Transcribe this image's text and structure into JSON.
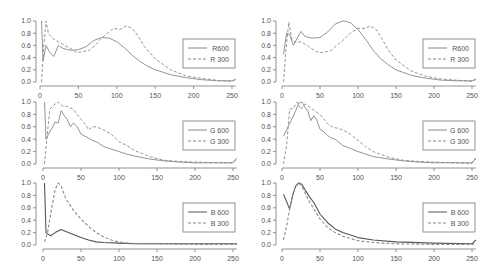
{
  "chart_data": [
    {
      "type": "line",
      "panel": "left-top",
      "xlim": [
        0,
        255
      ],
      "ylim": [
        0,
        1.0
      ],
      "xticks": [
        0,
        50,
        100,
        150,
        200,
        250
      ],
      "yticks": [
        "0.0",
        "0.2",
        "0.4",
        "0.6",
        "0.8",
        "1.0"
      ],
      "legend_position": "right",
      "series": [
        {
          "name": "R600",
          "style": "solid",
          "x": [
            2,
            4,
            8,
            12,
            18,
            24,
            30,
            36,
            42,
            50,
            60,
            70,
            80,
            90,
            100,
            110,
            120,
            130,
            140,
            150,
            170,
            190,
            210,
            230,
            250,
            255
          ],
          "y": [
            1.0,
            0.35,
            0.6,
            0.5,
            0.42,
            0.6,
            0.55,
            0.53,
            0.52,
            0.53,
            0.58,
            0.68,
            0.73,
            0.72,
            0.66,
            0.56,
            0.44,
            0.34,
            0.26,
            0.2,
            0.12,
            0.07,
            0.04,
            0.02,
            0.02,
            0.05
          ]
        },
        {
          "name": "R 300",
          "style": "dashed",
          "x": [
            2,
            5,
            8,
            11,
            16,
            24,
            32,
            40,
            48,
            56,
            64,
            72,
            80,
            88,
            96,
            104,
            112,
            120,
            128,
            136,
            150,
            170,
            190,
            210,
            230,
            250,
            255
          ],
          "y": [
            0.0,
            0.6,
            1.0,
            0.8,
            0.72,
            0.66,
            0.6,
            0.55,
            0.48,
            0.5,
            0.52,
            0.6,
            0.72,
            0.8,
            0.88,
            0.86,
            0.92,
            0.88,
            0.75,
            0.58,
            0.38,
            0.2,
            0.1,
            0.06,
            0.03,
            0.01,
            0.04
          ]
        }
      ]
    },
    {
      "type": "line",
      "panel": "right-top",
      "xlim": [
        0,
        255
      ],
      "ylim": [
        0,
        1.0
      ],
      "xticks": [
        0,
        50,
        100,
        150,
        200,
        250
      ],
      "yticks": [
        "0.0",
        "0.2",
        "0.4",
        "0.6",
        "0.8",
        "1.0"
      ],
      "legend_position": "right",
      "series": [
        {
          "name": "R600",
          "style": "solid",
          "x": [
            2,
            6,
            10,
            15,
            20,
            25,
            30,
            35,
            40,
            50,
            60,
            70,
            80,
            85,
            90,
            100,
            110,
            120,
            130,
            140,
            150,
            170,
            190,
            210,
            230,
            250,
            255
          ],
          "y": [
            0.45,
            0.8,
            0.78,
            0.6,
            0.72,
            0.83,
            0.75,
            0.73,
            0.72,
            0.73,
            0.82,
            0.95,
            1.0,
            0.99,
            0.97,
            0.86,
            0.7,
            0.52,
            0.38,
            0.28,
            0.2,
            0.11,
            0.06,
            0.03,
            0.02,
            0.02,
            0.05
          ]
        },
        {
          "name": "R 300",
          "style": "dashed",
          "x": [
            2,
            5,
            9,
            13,
            18,
            25,
            35,
            45,
            50,
            60,
            65,
            70,
            80,
            90,
            100,
            110,
            116,
            124,
            132,
            140,
            150,
            170,
            190,
            210,
            230,
            250,
            255
          ],
          "y": [
            0.0,
            0.5,
            0.98,
            0.7,
            0.65,
            0.66,
            0.58,
            0.5,
            0.48,
            0.5,
            0.52,
            0.58,
            0.68,
            0.8,
            0.88,
            0.88,
            0.92,
            0.86,
            0.7,
            0.52,
            0.36,
            0.18,
            0.09,
            0.05,
            0.03,
            0.01,
            0.04
          ]
        }
      ]
    },
    {
      "type": "line",
      "panel": "left-middle",
      "xlim": [
        0,
        255
      ],
      "ylim": [
        0,
        1.0
      ],
      "xticks": [
        0,
        50,
        100,
        150,
        200,
        250
      ],
      "yticks": [
        "0.0",
        "0.2",
        "0.4",
        "0.6",
        "0.8",
        "1.0"
      ],
      "legend_position": "right",
      "series": [
        {
          "name": "G 600",
          "style": "solid",
          "x": [
            2,
            4,
            8,
            12,
            16,
            20,
            24,
            28,
            32,
            36,
            40,
            45,
            50,
            55,
            60,
            65,
            70,
            75,
            80,
            90,
            100,
            110,
            120,
            140,
            160,
            180,
            200,
            230,
            250,
            255
          ],
          "y": [
            1.0,
            0.4,
            0.5,
            0.58,
            0.68,
            0.66,
            0.86,
            0.78,
            0.72,
            0.6,
            0.66,
            0.6,
            0.48,
            0.45,
            0.42,
            0.38,
            0.36,
            0.32,
            0.28,
            0.24,
            0.2,
            0.16,
            0.13,
            0.08,
            0.05,
            0.03,
            0.02,
            0.02,
            0.02,
            0.1
          ]
        },
        {
          "name": "G 300",
          "style": "dashed",
          "x": [
            2,
            5,
            9,
            14,
            20,
            26,
            32,
            40,
            50,
            55,
            60,
            65,
            70,
            80,
            90,
            95,
            100,
            110,
            120,
            140,
            160,
            180,
            200,
            230,
            250,
            255
          ],
          "y": [
            0.0,
            0.4,
            0.88,
            0.95,
            1.0,
            0.93,
            0.93,
            0.88,
            0.72,
            0.65,
            0.55,
            0.6,
            0.6,
            0.55,
            0.48,
            0.42,
            0.36,
            0.3,
            0.22,
            0.12,
            0.06,
            0.04,
            0.03,
            0.02,
            0.02,
            0.08
          ]
        }
      ]
    },
    {
      "type": "line",
      "panel": "right-middle",
      "xlim": [
        0,
        255
      ],
      "ylim": [
        0,
        1.0
      ],
      "xticks": [
        0,
        50,
        100,
        150,
        200,
        250
      ],
      "yticks": [
        "0.0",
        "0.2",
        "0.4",
        "0.6",
        "0.8",
        "1.0"
      ],
      "legend_position": "right",
      "series": [
        {
          "name": "G 600",
          "style": "solid",
          "x": [
            2,
            6,
            10,
            14,
            18,
            22,
            26,
            30,
            34,
            38,
            42,
            46,
            50,
            55,
            60,
            65,
            70,
            75,
            80,
            90,
            100,
            110,
            120,
            140,
            160,
            180,
            200,
            230,
            250,
            255
          ],
          "y": [
            0.45,
            0.55,
            0.65,
            0.75,
            0.86,
            0.98,
            1.0,
            0.92,
            0.85,
            0.7,
            0.78,
            0.7,
            0.56,
            0.52,
            0.46,
            0.42,
            0.4,
            0.35,
            0.3,
            0.25,
            0.2,
            0.16,
            0.12,
            0.08,
            0.05,
            0.03,
            0.02,
            0.02,
            0.02,
            0.1
          ]
        },
        {
          "name": "G 300",
          "style": "dashed",
          "x": [
            2,
            6,
            10,
            15,
            20,
            25,
            30,
            36,
            44,
            50,
            60,
            66,
            72,
            80,
            90,
            96,
            100,
            110,
            120,
            140,
            160,
            180,
            200,
            230,
            250,
            255
          ],
          "y": [
            0.0,
            0.3,
            0.88,
            0.9,
            1.0,
            0.88,
            0.97,
            0.92,
            0.85,
            0.8,
            0.65,
            0.6,
            0.58,
            0.55,
            0.48,
            0.42,
            0.38,
            0.28,
            0.2,
            0.11,
            0.06,
            0.04,
            0.03,
            0.02,
            0.01,
            0.08
          ]
        }
      ]
    },
    {
      "type": "line",
      "panel": "left-bottom",
      "xlim": [
        0,
        255
      ],
      "ylim": [
        0,
        1.0
      ],
      "xticks": [
        0,
        50,
        100,
        150,
        200,
        250
      ],
      "yticks": [
        "0.0",
        "0.2",
        "0.4",
        "0.6",
        "0.8",
        "1.0"
      ],
      "legend_position": "right",
      "series": [
        {
          "name": "B 600",
          "style": "solid",
          "x": [
            2,
            4,
            10,
            16,
            24,
            30,
            40,
            50,
            60,
            70,
            80,
            100,
            120,
            150,
            200,
            250,
            255
          ],
          "y": [
            1.0,
            0.2,
            0.15,
            0.2,
            0.25,
            0.22,
            0.17,
            0.12,
            0.08,
            0.05,
            0.04,
            0.03,
            0.02,
            0.02,
            0.02,
            0.02,
            0.02
          ]
        },
        {
          "name": "B 300",
          "style": "dashed",
          "x": [
            2,
            6,
            10,
            16,
            20,
            24,
            30,
            40,
            50,
            60,
            70,
            80,
            90,
            100,
            110,
            130,
            150,
            200,
            250,
            255
          ],
          "y": [
            0.05,
            0.2,
            0.5,
            0.9,
            1.0,
            0.95,
            0.75,
            0.56,
            0.42,
            0.3,
            0.2,
            0.13,
            0.08,
            0.05,
            0.03,
            0.02,
            0.02,
            0.01,
            0.01,
            0.01
          ]
        }
      ]
    },
    {
      "type": "line",
      "panel": "right-bottom",
      "xlim": [
        0,
        255
      ],
      "ylim": [
        0,
        1.0
      ],
      "xticks": [
        0,
        50,
        100,
        150,
        200,
        250
      ],
      "yticks": [
        "0.0",
        "0.2",
        "0.4",
        "0.6",
        "0.8",
        "1.0"
      ],
      "legend_position": "right",
      "series": [
        {
          "name": "B 600",
          "style": "solid",
          "x": [
            2,
            6,
            10,
            14,
            18,
            22,
            26,
            30,
            36,
            42,
            50,
            60,
            70,
            80,
            100,
            120,
            150,
            200,
            250,
            255
          ],
          "y": [
            0.82,
            0.7,
            0.58,
            0.8,
            0.95,
            1.0,
            0.98,
            0.9,
            0.78,
            0.68,
            0.5,
            0.36,
            0.26,
            0.2,
            0.12,
            0.08,
            0.05,
            0.03,
            0.02,
            0.08
          ]
        },
        {
          "name": "B 300",
          "style": "dashed",
          "x": [
            2,
            6,
            10,
            14,
            18,
            22,
            26,
            30,
            36,
            42,
            50,
            60,
            70,
            80,
            100,
            120,
            150,
            200,
            250,
            255
          ],
          "y": [
            0.08,
            0.3,
            0.58,
            0.8,
            0.95,
            1.0,
            0.95,
            0.85,
            0.7,
            0.58,
            0.42,
            0.28,
            0.2,
            0.14,
            0.07,
            0.04,
            0.02,
            0.01,
            0.01,
            0.02
          ]
        }
      ]
    }
  ]
}
